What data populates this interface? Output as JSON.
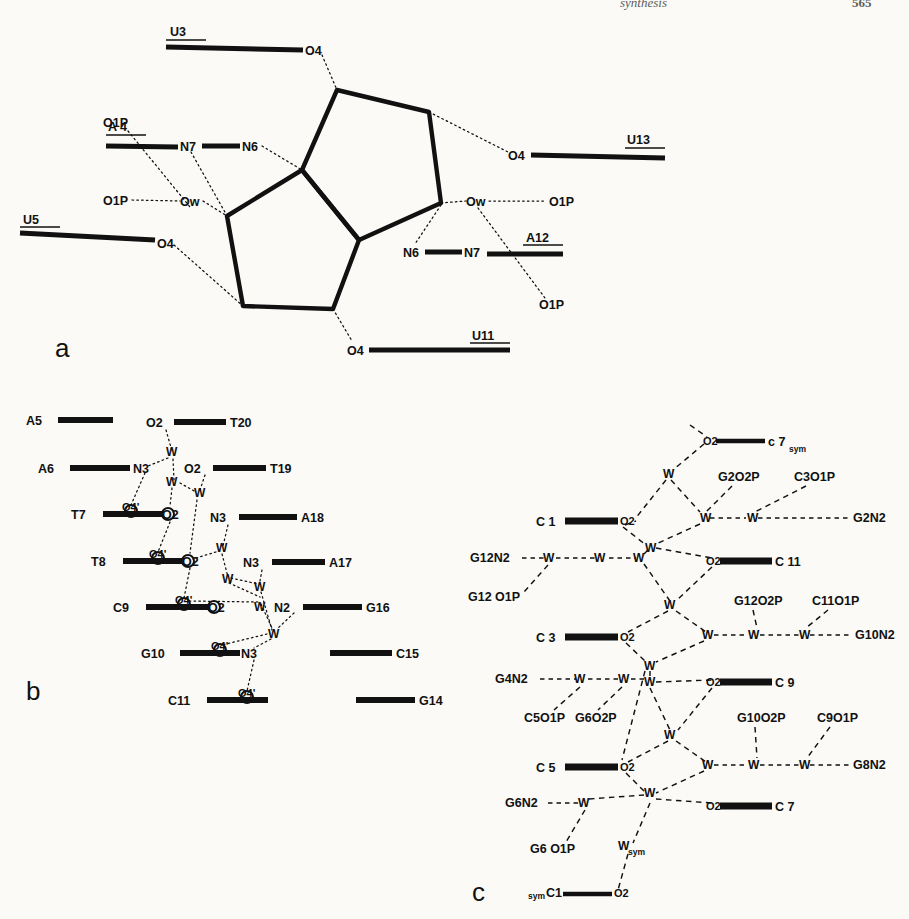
{
  "header": {
    "middle": "synthesis",
    "page": "565"
  },
  "figure": {
    "panels": [
      {
        "id": "a",
        "letter": "a",
        "caption_letter": "a"
      },
      {
        "id": "b",
        "letter": "b",
        "caption_letter": "b"
      },
      {
        "id": "c",
        "letter": "c",
        "caption_letter": "c"
      }
    ]
  },
  "panel_a": {
    "letter": "a",
    "description": "Two fused pentagonal water pentagon rings with hydrogen bonds to base and phosphate atoms",
    "residue_labels": [
      {
        "name": "U3",
        "x": 178,
        "y": 36
      },
      {
        "name": "A 4",
        "x": 115,
        "y": 140
      },
      {
        "name": "U5",
        "x": 28,
        "y": 232
      },
      {
        "name": "U13",
        "x": 598,
        "y": 140
      },
      {
        "name": "A12",
        "x": 535,
        "y": 247
      },
      {
        "name": "U11",
        "x": 473,
        "y": 340
      }
    ],
    "atom_labels": [
      {
        "name": "O4",
        "x": 311,
        "y": 47
      },
      {
        "name": "O1P",
        "x": 113,
        "y": 122
      },
      {
        "name": "N7",
        "x": 186,
        "y": 141
      },
      {
        "name": "N6",
        "x": 248,
        "y": 141
      },
      {
        "name": "O1P",
        "x": 113,
        "y": 199
      },
      {
        "name": "Ow",
        "x": 190,
        "y": 200
      },
      {
        "name": "O4",
        "x": 163,
        "y": 243
      },
      {
        "name": "O4",
        "x": 516,
        "y": 152
      },
      {
        "name": "Ow",
        "x": 476,
        "y": 200
      },
      {
        "name": "O1P",
        "x": 555,
        "y": 200
      },
      {
        "name": "N6",
        "x": 411,
        "y": 247
      },
      {
        "name": "N7",
        "x": 470,
        "y": 247
      },
      {
        "name": "O1P",
        "x": 546,
        "y": 305
      },
      {
        "name": "O4",
        "x": 354,
        "y": 347
      }
    ]
  },
  "panel_b": {
    "letter": "b",
    "description": "Hydration network of a DNA dodecamer minor groove spine of hydration",
    "rows": [
      {
        "left": "A5",
        "right": "T20",
        "left_atom": "",
        "right_atom": "O2"
      },
      {
        "left": "A6",
        "right": "T19",
        "left_atom": "N3",
        "right_atom": "O2"
      },
      {
        "left": "T7",
        "right": "A18",
        "left_atom": "O2",
        "right_atom": "N3",
        "prime_atom": "O4'"
      },
      {
        "left": "T8",
        "right": "A17",
        "left_atom": "O2",
        "right_atom": "N3",
        "prime_atom": "O4'"
      },
      {
        "left": "C9",
        "right": "G16",
        "left_atom": "O2",
        "right_atom": "N2",
        "prime_atom": "O4'"
      },
      {
        "left": "G10",
        "right": "C15",
        "left_atom": "N3",
        "right_atom": "",
        "prime_atom": "O4'"
      },
      {
        "left": "C11",
        "right": "G14",
        "left_atom": "",
        "right_atom": "",
        "prime_atom": "O4'"
      }
    ],
    "water_label": "W",
    "water_count": 8
  },
  "panel_c": {
    "letter": "c",
    "description": "Hydration network of a Z-DNA / B-DNA hexamer showing water bridges between cytosine O2 and guanine N2/phosphate oxygens",
    "water_label": "W",
    "water_sym_label": "W",
    "sym_subscript": "sym",
    "strand_labels": [
      {
        "name": "C 1",
        "atom": "O2",
        "x": 502,
        "y": 521
      },
      {
        "name": "C 11",
        "atom": "O2",
        "x": 782,
        "y": 561
      },
      {
        "name": "C 3",
        "atom": "O2",
        "x": 502,
        "y": 637
      },
      {
        "name": "C 9",
        "atom": "O2",
        "x": 782,
        "y": 682
      },
      {
        "name": "C 5",
        "atom": "O2",
        "x": 502,
        "y": 767
      },
      {
        "name": "C 7",
        "atom": "O2",
        "x": 782,
        "y": 806
      },
      {
        "name": "c 7",
        "atom": "O2",
        "x": 710,
        "y": 441,
        "subscript": "sym"
      },
      {
        "name": "C1",
        "atom": "O2",
        "x": 555,
        "y": 894,
        "presubscript": "sym"
      }
    ],
    "terminal_labels": [
      {
        "name": "G2O2P",
        "x": 724,
        "y": 477
      },
      {
        "name": "C3O1P",
        "x": 800,
        "y": 477
      },
      {
        "name": "G2N2",
        "x": 855,
        "y": 521
      },
      {
        "name": "G12N2",
        "x": 488,
        "y": 561
      },
      {
        "name": "G12 O1P",
        "x": 487,
        "y": 601
      },
      {
        "name": "G12O2P",
        "x": 742,
        "y": 601
      },
      {
        "name": "C11O1P",
        "x": 822,
        "y": 601
      },
      {
        "name": "G10N2",
        "x": 858,
        "y": 637
      },
      {
        "name": "G4N2",
        "x": 508,
        "y": 682
      },
      {
        "name": "C5O1P",
        "x": 525,
        "y": 718
      },
      {
        "name": "G6O2P",
        "x": 578,
        "y": 718
      },
      {
        "name": "G10O2P",
        "x": 745,
        "y": 718
      },
      {
        "name": "C9O1P",
        "x": 824,
        "y": 718
      },
      {
        "name": "G8N2",
        "x": 855,
        "y": 767
      },
      {
        "name": "G6N2",
        "x": 518,
        "y": 806
      },
      {
        "name": "G6 O1P",
        "x": 540,
        "y": 849
      }
    ]
  }
}
